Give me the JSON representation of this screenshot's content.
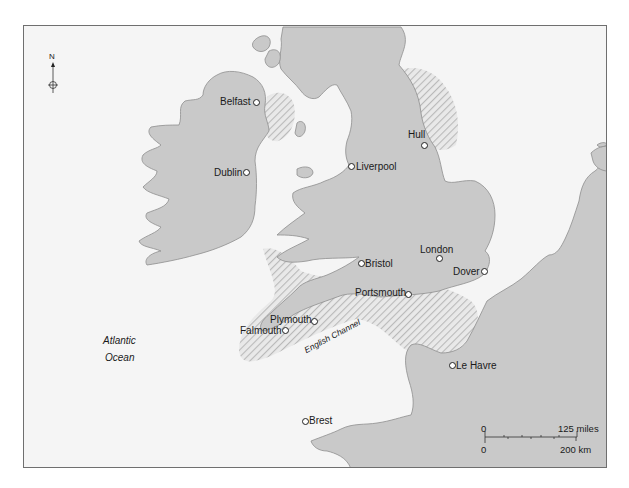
{
  "map": {
    "colors": {
      "sea": "#f5f5f5",
      "land": "#c9c9c9",
      "coast": "#8e8e8e",
      "hatch": "#b9b9b9",
      "frame": "#6f6f6f"
    },
    "compass": {
      "north_label": "N"
    },
    "water_labels": {
      "ocean_line1": "Atlantic",
      "ocean_line2": "Ocean",
      "channel": "English Channel"
    },
    "cities": [
      {
        "name": "Belfast"
      },
      {
        "name": "Dublin"
      },
      {
        "name": "Liverpool"
      },
      {
        "name": "Hull"
      },
      {
        "name": "Bristol"
      },
      {
        "name": "London"
      },
      {
        "name": "Dover"
      },
      {
        "name": "Portsmouth"
      },
      {
        "name": "Plymouth"
      },
      {
        "name": "Falmouth"
      },
      {
        "name": "Le Havre"
      },
      {
        "name": "Brest"
      }
    ],
    "scale_bar": {
      "top_start": "0",
      "top_end": "125 miles",
      "bottom_start": "0",
      "bottom_end": "200 km"
    }
  }
}
